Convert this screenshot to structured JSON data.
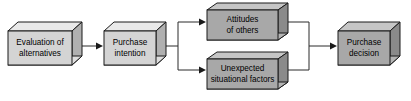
{
  "diagram": {
    "type": "flowchart",
    "background_color": "#ffffff",
    "colors": {
      "box_front_light": "#d4d4d4",
      "box_front_dark": "#a8a8a8",
      "box_top_light": "#e9e9e9",
      "box_top_dark": "#c6c6c6",
      "box_side_light": "#b0b0b0",
      "box_side_dark": "#8a8a8a",
      "outline": "#1a1a1a",
      "connector": "#2b2b2b",
      "label_text": "#000000"
    },
    "nodes": [
      {
        "id": "evaluation-of-alternatives",
        "lines": [
          "Evaluation of",
          "alternatives"
        ],
        "shade": "light"
      },
      {
        "id": "purchase-intention",
        "lines": [
          "Purchase",
          "intention"
        ],
        "shade": "light"
      },
      {
        "id": "attitudes-of-others",
        "lines": [
          "Attitudes",
          "of others"
        ],
        "shade": "dark"
      },
      {
        "id": "unexpected-situational-factors",
        "lines": [
          "Unexpected",
          "situational factors"
        ],
        "shade": "dark"
      },
      {
        "id": "purchase-decision",
        "lines": [
          "Purchase",
          "decision"
        ],
        "shade": "dark"
      }
    ],
    "connectors": [
      {
        "id": "evaluation-to-intention",
        "from": "evaluation-of-alternatives",
        "to": "purchase-intention",
        "arrow": true
      },
      {
        "id": "intention-to-attitudes",
        "from": "purchase-intention",
        "to": "attitudes-of-others",
        "arrow": true
      },
      {
        "id": "intention-to-unexpected",
        "from": "purchase-intention",
        "to": "unexpected-situational-factors",
        "arrow": true
      },
      {
        "id": "attitudes-to-decision",
        "from": "attitudes-of-others",
        "to": "purchase-decision",
        "arrow": true
      },
      {
        "id": "unexpected-to-decision",
        "from": "unexpected-situational-factors",
        "to": "purchase-decision",
        "arrow": true
      }
    ]
  }
}
